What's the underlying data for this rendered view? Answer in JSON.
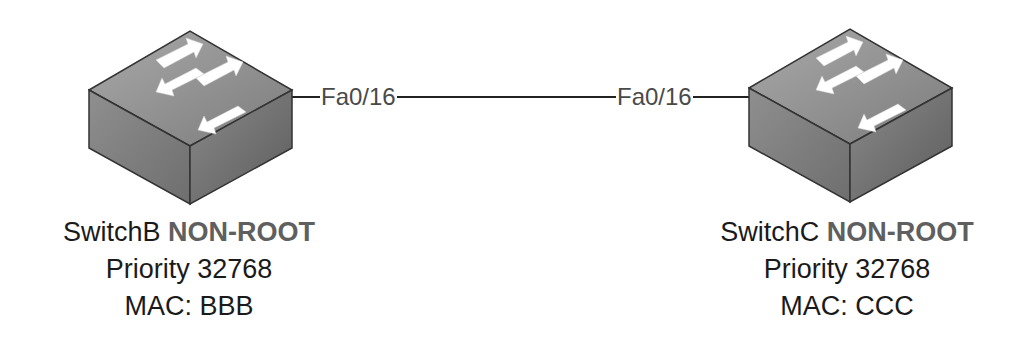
{
  "diagram": {
    "type": "network-topology",
    "colors": {
      "line": "#222222",
      "port_text": "#4a4a4a",
      "label_text": "#1a1a1a",
      "role_text": "#5f5f5f",
      "switch_top": "#8a8a8a",
      "switch_left": "#7a7a7a",
      "switch_right": "#6a6a6a",
      "arrow": "#ffffff"
    },
    "nodes": [
      {
        "id": "SwitchB",
        "icon": "switch-icon",
        "name": "SwitchB",
        "role": "NON-ROOT",
        "priority_line": "Priority 32768",
        "mac_line": "MAC: BBB"
      },
      {
        "id": "SwitchC",
        "icon": "switch-icon",
        "name": "SwitchC",
        "role": "NON-ROOT",
        "priority_line": "Priority 32768",
        "mac_line": "MAC: CCC"
      }
    ],
    "links": [
      {
        "from": "SwitchB",
        "to": "SwitchC",
        "from_port": "Fa0/16",
        "to_port": "Fa0/16"
      }
    ]
  }
}
